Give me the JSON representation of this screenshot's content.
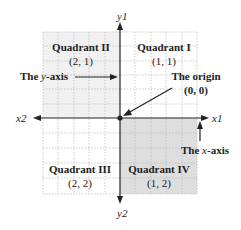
{
  "axes": {
    "y_top_label": "y1",
    "y_bottom_label": "y2",
    "x_left_label": "x2",
    "x_right_label": "x1"
  },
  "quadrants": [
    {
      "name": "Quadrant I",
      "coords": "(1, 1)"
    },
    {
      "name": "Quadrant II",
      "coords": "(2, 1)"
    },
    {
      "name": "Quadrant III",
      "coords": "(2, 2)"
    },
    {
      "name": "Quadrant IV",
      "coords": "(1, 2)"
    }
  ],
  "annotations": {
    "y_axis": {
      "prefix": "The ",
      "var": "y",
      "suffix": "-axis"
    },
    "x_axis": {
      "prefix": "The ",
      "var": "x",
      "suffix": "-axis"
    },
    "origin": {
      "label": "The origin",
      "coords": "(0, 0)"
    }
  },
  "colors": {
    "quadrant_ii_fill": "#f1f1f1",
    "quadrant_iv_fill": "#dedede",
    "grid": "#b8b8b8",
    "axis": "#222222"
  }
}
